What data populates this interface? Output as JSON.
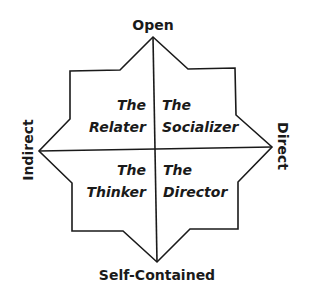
{
  "axes": {
    "top": "Open",
    "bottom": "Self-Contained",
    "left": "Indirect",
    "right": "Direct"
  },
  "quadrants": {
    "top_left": {
      "line1": "The",
      "line2": "Relater"
    },
    "top_right": {
      "line1": "The",
      "line2": "Socializer"
    },
    "bottom_left": {
      "line1": "The",
      "line2": "Thinker"
    },
    "bottom_right": {
      "line1": "The",
      "line2": "Director"
    }
  },
  "colors": {
    "stroke": "#1a1a1a",
    "background": "#ffffff"
  }
}
